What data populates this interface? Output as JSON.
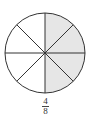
{
  "figure": {
    "type": "fraction-circle",
    "total_parts": 8,
    "shaded_parts": 4,
    "shaded_side": "right",
    "shade_color": "#e6e6e6",
    "stroke_color": "#333333",
    "fill_color": "#ffffff"
  },
  "fraction": {
    "numerator": "4",
    "denominator": "8"
  }
}
